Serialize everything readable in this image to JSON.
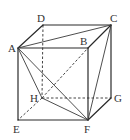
{
  "diagram": {
    "type": "cube",
    "vertices": {
      "A": {
        "x": 18,
        "y": 48,
        "label": "A",
        "lx": 8,
        "ly": 50
      },
      "B": {
        "x": 88,
        "y": 48,
        "label": "B",
        "lx": 80,
        "ly": 45
      },
      "C": {
        "x": 111,
        "y": 25,
        "label": "C",
        "lx": 111,
        "ly": 21
      },
      "D": {
        "x": 43,
        "y": 25,
        "label": "D",
        "lx": 37,
        "ly": 21
      },
      "E": {
        "x": 18,
        "y": 120,
        "label": "E",
        "lx": 12,
        "ly": 133
      },
      "F": {
        "x": 88,
        "y": 120,
        "label": "F",
        "lx": 84,
        "ly": 133
      },
      "G": {
        "x": 111,
        "y": 98,
        "label": "G",
        "lx": 115,
        "ly": 103
      },
      "H": {
        "x": 42,
        "y": 98,
        "label": "H",
        "lx": 29,
        "ly": 102
      }
    },
    "solid_edges": [
      "AB",
      "AD",
      "DC",
      "BC",
      "AE",
      "EF",
      "BF",
      "FG",
      "CG"
    ],
    "hidden_edges": [
      "DH",
      "HG",
      "HE"
    ],
    "solid_diagonals": [
      "AC",
      "AH",
      "AF",
      "HF",
      "CF"
    ],
    "hidden_diagonals": [
      "HB"
    ],
    "labels": [
      "A",
      "B",
      "C",
      "D",
      "E",
      "F",
      "G",
      "H"
    ]
  }
}
